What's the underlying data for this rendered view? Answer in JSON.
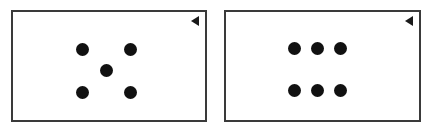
{
  "canvas": {
    "width": 434,
    "height": 132,
    "background_color": "#ffffff"
  },
  "style": {
    "panel_background": "#ffffff",
    "panel_border_color": "#3a3a3a",
    "panel_border_width": 2,
    "dot_color": "#111111",
    "marker_color": "#1a1a1a"
  },
  "panels": [
    {
      "id": "panel-left",
      "label": "left-panel",
      "pattern_name": "five-dot-quincunx",
      "dot_count": 5,
      "x": 11,
      "y": 10,
      "width": 196,
      "height": 112,
      "marker": {
        "name": "left-pointing-triangle",
        "glyph": "◀",
        "position": "top-right"
      },
      "dots": [
        {
          "cx": 69,
          "cy": 37,
          "d": 13
        },
        {
          "cx": 117,
          "cy": 37,
          "d": 13
        },
        {
          "cx": 93,
          "cy": 58,
          "d": 13
        },
        {
          "cx": 69,
          "cy": 80,
          "d": 13
        },
        {
          "cx": 117,
          "cy": 80,
          "d": 13
        }
      ]
    },
    {
      "id": "panel-right",
      "label": "right-panel",
      "pattern_name": "six-dot-grid-3x2",
      "dot_count": 6,
      "x": 224,
      "y": 10,
      "width": 197,
      "height": 112,
      "marker": {
        "name": "left-pointing-triangle",
        "glyph": "◀",
        "position": "top-right"
      },
      "dots": [
        {
          "cx": 68,
          "cy": 36,
          "d": 13
        },
        {
          "cx": 91,
          "cy": 36,
          "d": 13
        },
        {
          "cx": 114,
          "cy": 36,
          "d": 13
        },
        {
          "cx": 68,
          "cy": 78,
          "d": 13
        },
        {
          "cx": 91,
          "cy": 78,
          "d": 13
        },
        {
          "cx": 114,
          "cy": 78,
          "d": 13
        }
      ]
    }
  ]
}
